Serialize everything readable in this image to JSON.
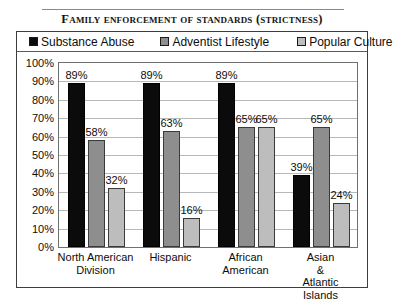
{
  "chart_data": {
    "type": "bar",
    "title": "Family enforcement of standards (strictness)",
    "xlabel": "",
    "ylabel": "",
    "ylim": [
      0,
      100
    ],
    "ytick_labels": [
      "100%",
      "90%",
      "80%",
      "70%",
      "60%",
      "50%",
      "40%",
      "30%",
      "20%",
      "10%",
      "0%"
    ],
    "ytick_values": [
      100,
      90,
      80,
      70,
      60,
      50,
      40,
      30,
      20,
      10,
      0
    ],
    "grid": true,
    "legend_position": "top",
    "categories": [
      "North American\nDivision",
      "Hispanic",
      "African\nAmerican",
      "Asian & Atlantic\nIslands"
    ],
    "series": [
      {
        "name": "Substance Abuse",
        "color": "#0b0b0b",
        "values": [
          89,
          89,
          89,
          39
        ],
        "labels": [
          "89%",
          "89%",
          "89%",
          "39%"
        ]
      },
      {
        "name": "Adventist Lifestyle",
        "color": "#8e8e8e",
        "values": [
          58,
          63,
          65,
          65
        ],
        "labels": [
          "58%",
          "63%",
          "65%",
          "65%"
        ]
      },
      {
        "name": "Popular Culture",
        "color": "#bdbdbd",
        "values": [
          32,
          16,
          65,
          24
        ],
        "labels": [
          "32%",
          "16%",
          "65%",
          "24%"
        ]
      }
    ]
  }
}
